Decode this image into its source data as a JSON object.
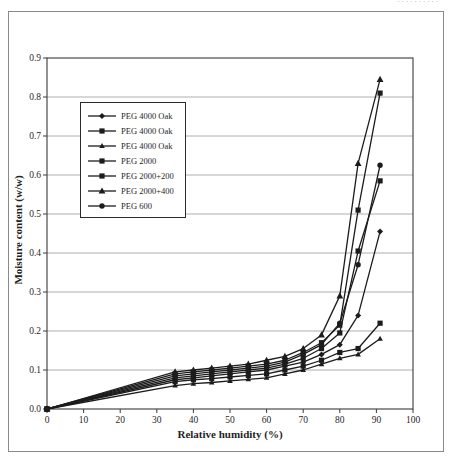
{
  "page": {
    "top_fragment": "..........",
    "background": "#ffffff"
  },
  "colors": {
    "line": "#1c1c1c",
    "grid": "#9a9a9a",
    "axis": "#3a3a3a",
    "frame": "#8a8a8a",
    "text": "#1f1f1f"
  },
  "chart_data": {
    "type": "line",
    "title": "",
    "xlabel": "Relative humidity (%)",
    "ylabel": "Moisture content (w/w)",
    "xlim": [
      0,
      100
    ],
    "ylim": [
      0,
      0.9
    ],
    "x_ticks": [
      0,
      10,
      20,
      30,
      40,
      50,
      60,
      70,
      80,
      90,
      100
    ],
    "y_ticks": [
      0,
      0.1,
      0.2,
      0.3,
      0.4,
      0.5,
      0.6,
      0.7,
      0.8,
      0.9
    ],
    "y_tick_labels": [
      "0.0",
      "0.1",
      "0.2",
      "0.3",
      "0.4",
      "0.5",
      "0.6",
      "0.7",
      "0.8",
      "0.9"
    ],
    "grid": "horizontal",
    "legend_position": "upper-left",
    "series": [
      {
        "name": "PEG 4000 Oak",
        "marker": "diamond",
        "data": [
          [
            0,
            0
          ],
          [
            35,
            0.075
          ],
          [
            40,
            0.08
          ],
          [
            45,
            0.085
          ],
          [
            50,
            0.09
          ],
          [
            55,
            0.095
          ],
          [
            60,
            0.1
          ],
          [
            65,
            0.11
          ],
          [
            70,
            0.12
          ],
          [
            75,
            0.14
          ],
          [
            80,
            0.165
          ],
          [
            85,
            0.24
          ],
          [
            91,
            0.455
          ]
        ]
      },
      {
        "name": "PEG 4000 Oak",
        "marker": "square",
        "data": [
          [
            0,
            0
          ],
          [
            35,
            0.07
          ],
          [
            40,
            0.075
          ],
          [
            45,
            0.078
          ],
          [
            50,
            0.082
          ],
          [
            55,
            0.086
          ],
          [
            60,
            0.09
          ],
          [
            65,
            0.1
          ],
          [
            70,
            0.11
          ],
          [
            75,
            0.125
          ],
          [
            80,
            0.145
          ],
          [
            85,
            0.155
          ],
          [
            91,
            0.22
          ]
        ]
      },
      {
        "name": "PEG 4000 Oak",
        "marker": "triangle-small",
        "data": [
          [
            0,
            0
          ],
          [
            35,
            0.06
          ],
          [
            40,
            0.065
          ],
          [
            45,
            0.068
          ],
          [
            50,
            0.072
          ],
          [
            55,
            0.076
          ],
          [
            60,
            0.08
          ],
          [
            65,
            0.09
          ],
          [
            70,
            0.1
          ],
          [
            75,
            0.115
          ],
          [
            80,
            0.13
          ],
          [
            85,
            0.14
          ],
          [
            91,
            0.18
          ]
        ]
      },
      {
        "name": "PEG 2000",
        "marker": "square",
        "data": [
          [
            0,
            0
          ],
          [
            35,
            0.08
          ],
          [
            40,
            0.085
          ],
          [
            45,
            0.09
          ],
          [
            50,
            0.095
          ],
          [
            55,
            0.1
          ],
          [
            60,
            0.105
          ],
          [
            65,
            0.115
          ],
          [
            70,
            0.13
          ],
          [
            75,
            0.155
          ],
          [
            80,
            0.195
          ],
          [
            85,
            0.405
          ],
          [
            91,
            0.585
          ]
        ]
      },
      {
        "name": "PEG 2000+200",
        "marker": "square",
        "data": [
          [
            0,
            0
          ],
          [
            35,
            0.09
          ],
          [
            40,
            0.095
          ],
          [
            45,
            0.1
          ],
          [
            50,
            0.105
          ],
          [
            55,
            0.11
          ],
          [
            60,
            0.115
          ],
          [
            65,
            0.125
          ],
          [
            70,
            0.145
          ],
          [
            75,
            0.17
          ],
          [
            80,
            0.215
          ],
          [
            85,
            0.51
          ],
          [
            91,
            0.81
          ]
        ]
      },
      {
        "name": "PEG 2000+400",
        "marker": "triangle",
        "data": [
          [
            0,
            0
          ],
          [
            35,
            0.095
          ],
          [
            40,
            0.1
          ],
          [
            45,
            0.105
          ],
          [
            50,
            0.11
          ],
          [
            55,
            0.115
          ],
          [
            60,
            0.125
          ],
          [
            65,
            0.135
          ],
          [
            70,
            0.155
          ],
          [
            75,
            0.19
          ],
          [
            80,
            0.29
          ],
          [
            85,
            0.63
          ],
          [
            91,
            0.845
          ]
        ]
      },
      {
        "name": "PEG 600",
        "marker": "circle",
        "data": [
          [
            0,
            0
          ],
          [
            35,
            0.085
          ],
          [
            40,
            0.09
          ],
          [
            45,
            0.095
          ],
          [
            50,
            0.1
          ],
          [
            55,
            0.105
          ],
          [
            60,
            0.11
          ],
          [
            65,
            0.12
          ],
          [
            70,
            0.14
          ],
          [
            75,
            0.165
          ],
          [
            80,
            0.22
          ],
          [
            85,
            0.37
          ],
          [
            91,
            0.625
          ]
        ]
      }
    ]
  }
}
